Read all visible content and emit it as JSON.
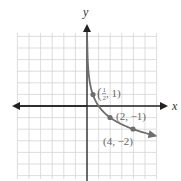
{
  "chart_data": {
    "type": "line",
    "title": "",
    "xlabel": "x",
    "ylabel": "y",
    "function": "y = log_{1/2}(x)",
    "xlim": [
      -6,
      6
    ],
    "ylim": [
      -6,
      6
    ],
    "grid": true,
    "grid_step": 1,
    "points": [
      {
        "x": 0.5,
        "y": 1,
        "label_num": "1",
        "label_den": "2",
        "label_rest": ", 1)"
      },
      {
        "x": 2,
        "y": -1,
        "label": "(2, −1)"
      },
      {
        "x": 4,
        "y": -2,
        "label": "(4, −2)"
      }
    ],
    "curve_color": "#6e6e6e",
    "axis_color": "#222222",
    "grid_color": "#d4d4d4"
  },
  "labels": {
    "x_axis": "x",
    "y_axis": "y",
    "p1_open": "(",
    "p1_num": "1",
    "p1_den": "2",
    "p1_rest": ", 1)",
    "p2": "(2, −1)",
    "p3": "(4, −2)"
  }
}
